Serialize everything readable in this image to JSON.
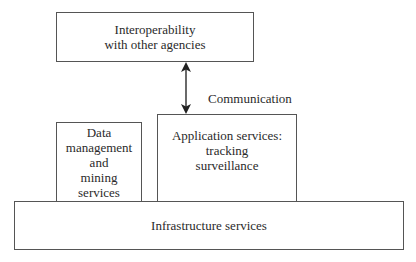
{
  "diagram": {
    "type": "layered-architecture",
    "boxes": {
      "interoperability": {
        "lines": [
          "Interoperability",
          "with other agencies"
        ]
      },
      "application": {
        "lines": [
          "Application services:",
          "tracking",
          "surveillance"
        ]
      },
      "data": {
        "lines": [
          "Data",
          "management",
          "and",
          "mining",
          "services"
        ]
      },
      "infrastructure": {
        "lines": [
          "Infrastructure services"
        ]
      }
    },
    "connectors": [
      {
        "from": "interoperability",
        "to": "application",
        "style": "double-headed-arrow",
        "label": "Communication"
      }
    ],
    "colors": {
      "border": "#555555",
      "text": "#2a2a2a",
      "background": "#ffffff"
    }
  }
}
